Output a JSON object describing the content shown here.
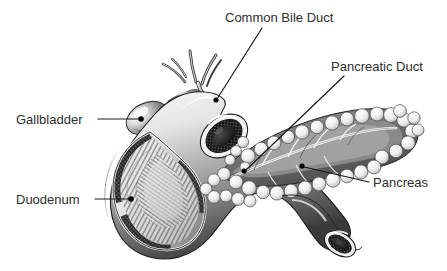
{
  "figure": {
    "background_color": "#ffffff",
    "text_color": "#2e2e2e",
    "leader_color": "#1a1a1a",
    "width": 447,
    "height": 271
  },
  "labels": {
    "common_bile_duct": "Common Bile Duct",
    "pancreatic_duct": "Pancreatic Duct",
    "pancreas": "Pancreas",
    "gallbladder": "Gallbladder",
    "duodenum": "Duodenum"
  },
  "structures": {
    "duodenum_name": "duodenum",
    "pancreas_name": "pancreas",
    "gallbladder_name": "gallbladder",
    "common_bile_duct_name": "common-bile-duct",
    "pancreatic_duct_name": "pancreatic-duct",
    "hepatic_ducts_name": "hepatic-ducts",
    "duodenal_papilla_name": "duodenal-papilla",
    "jejunum_stump_name": "jejunum-cut-end"
  }
}
